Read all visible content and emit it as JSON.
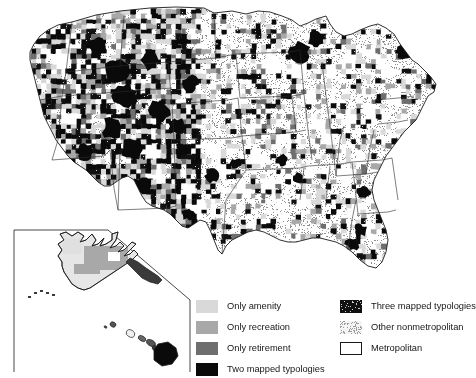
{
  "figure": {
    "kind": "choropleth-map",
    "region": "United States counties with Alaska and Hawaii inset"
  },
  "legend": {
    "columns": [
      {
        "name": "left",
        "entries": [
          {
            "label": "Only amenity",
            "swatch": "solid-light-gray",
            "color": "#d9d9d9",
            "icon": "swatch-only-amenity"
          },
          {
            "label": "Only recreation",
            "swatch": "solid-mid-gray",
            "color": "#a8a8a8",
            "icon": "swatch-only-recreation"
          },
          {
            "label": "Only retirement",
            "swatch": "solid-dark-gray",
            "color": "#6e6e6e",
            "icon": "swatch-only-retirement"
          },
          {
            "label": "Two mapped typologies",
            "swatch": "solid-black",
            "color": "#0a0a0a",
            "icon": "swatch-two-mapped-typologies"
          }
        ]
      },
      {
        "name": "right",
        "entries": [
          {
            "label": "Three mapped typologies",
            "swatch": "black-speckled",
            "color": "#111111",
            "icon": "swatch-three-mapped-typologies"
          },
          {
            "label": "Other nonmetropolitan",
            "swatch": "light-stipple",
            "color": "#efefef",
            "icon": "swatch-other-nonmetropolitan"
          },
          {
            "label": "Metropolitan",
            "swatch": "white-outlined",
            "color": "#ffffff",
            "icon": "swatch-metropolitan"
          }
        ]
      }
    ]
  },
  "map": {
    "classes": {
      "amenity": "#d9d9d9",
      "recreation": "#a8a8a8",
      "retirement": "#6e6e6e",
      "two": "#0a0a0a",
      "three": "#111111",
      "other_nonmetro": "#efefef",
      "metropolitan": "#ffffff"
    },
    "outline": "#1a1a1a",
    "inset_label": "Alaska and Hawaii inset"
  }
}
